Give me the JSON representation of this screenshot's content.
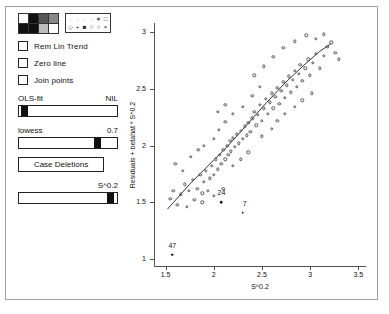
{
  "window": {
    "title": ""
  },
  "panel": {
    "shade_palette": {
      "name": "fill-shade-palette",
      "cells": [
        "#ffffff",
        "#111111",
        "#555555",
        "#888888",
        "#111111",
        "#111111",
        "#bbbbbb",
        "#ffffff"
      ]
    },
    "symbol_palette": {
      "name": "plot-symbol-palette",
      "glyphs": [
        "·",
        "·",
        "·",
        "·",
        "∗",
        "□",
        "◇",
        "+",
        "■",
        "○",
        "○",
        "×"
      ]
    },
    "checkboxes": [
      {
        "label": "Rem Lin Trend",
        "checked": false
      },
      {
        "label": "Zero line",
        "checked": false
      },
      {
        "label": "Join points",
        "checked": false
      }
    ],
    "sliders": [
      {
        "label": "OLS-fit",
        "value": "NIL",
        "thumb_pct": 2
      },
      {
        "label": "lowess",
        "value": "0.7",
        "thumb_pct": 77
      },
      {
        "label": "",
        "value": "S^0.2",
        "thumb_pct": 90
      }
    ],
    "buttons": [
      {
        "label": "Case Deletions"
      }
    ]
  },
  "chart_data": {
    "type": "scatter",
    "title": "",
    "xlabel": "S^0.2",
    "ylabel": "Residuals + betahat * S^0.2",
    "xlim": [
      1.38,
      3.58
    ],
    "ylim": [
      0.93,
      3.08
    ],
    "xticks": [
      1.5,
      2,
      2.5,
      3,
      3.5
    ],
    "xticklabels": [
      "1.5",
      "2",
      "2.5",
      "3",
      "3.5"
    ],
    "yticks": [
      1,
      1.5,
      2,
      2.5,
      3
    ],
    "yticklabels": [
      "1",
      "1.5",
      "2",
      "2.5",
      "3"
    ],
    "grid": false,
    "legend": null,
    "marker": "open-circle",
    "fit_line": {
      "name": "lowess-fit-line",
      "points": [
        [
          1.52,
          1.44
        ],
        [
          1.75,
          1.66
        ],
        [
          1.95,
          1.83
        ],
        [
          2.15,
          2.0
        ],
        [
          2.35,
          2.19
        ],
        [
          2.55,
          2.38
        ],
        [
          2.75,
          2.56
        ],
        [
          2.95,
          2.72
        ],
        [
          3.1,
          2.83
        ],
        [
          3.22,
          2.9
        ]
      ]
    },
    "points": [
      [
        1.55,
        1.53
      ],
      [
        1.58,
        1.6
      ],
      [
        1.62,
        1.48
      ],
      [
        1.66,
        1.57
      ],
      [
        1.7,
        1.66
      ],
      [
        1.74,
        1.6
      ],
      [
        1.78,
        1.7
      ],
      [
        1.8,
        1.52
      ],
      [
        1.83,
        1.62
      ],
      [
        1.86,
        1.74
      ],
      [
        1.88,
        1.58
      ],
      [
        1.9,
        1.68
      ],
      [
        1.92,
        1.78
      ],
      [
        1.94,
        1.6
      ],
      [
        1.96,
        1.71
      ],
      [
        1.98,
        1.82
      ],
      [
        2.0,
        1.74
      ],
      [
        2.02,
        1.88
      ],
      [
        2.04,
        1.79
      ],
      [
        2.06,
        1.92
      ],
      [
        2.08,
        1.84
      ],
      [
        2.1,
        1.96
      ],
      [
        2.12,
        1.88
      ],
      [
        2.14,
        2.0
      ],
      [
        2.15,
        1.92
      ],
      [
        2.17,
        2.04
      ],
      [
        2.18,
        1.95
      ],
      [
        2.2,
        2.07
      ],
      [
        2.22,
        1.99
      ],
      [
        2.24,
        2.1
      ],
      [
        2.26,
        2.02
      ],
      [
        2.28,
        2.13
      ],
      [
        2.3,
        2.06
      ],
      [
        2.32,
        2.17
      ],
      [
        2.34,
        2.09
      ],
      [
        2.36,
        2.2
      ],
      [
        2.38,
        2.12
      ],
      [
        2.4,
        2.24
      ],
      [
        2.42,
        2.3
      ],
      [
        2.44,
        2.18
      ],
      [
        2.46,
        2.27
      ],
      [
        2.48,
        2.36
      ],
      [
        2.5,
        2.22
      ],
      [
        2.52,
        2.33
      ],
      [
        2.54,
        2.41
      ],
      [
        2.56,
        2.28
      ],
      [
        2.58,
        2.38
      ],
      [
        2.6,
        2.46
      ],
      [
        2.62,
        2.33
      ],
      [
        2.64,
        2.43
      ],
      [
        2.66,
        2.51
      ],
      [
        2.68,
        2.37
      ],
      [
        2.7,
        2.48
      ],
      [
        2.72,
        2.56
      ],
      [
        2.74,
        2.42
      ],
      [
        2.76,
        2.53
      ],
      [
        2.78,
        2.61
      ],
      [
        2.8,
        2.47
      ],
      [
        2.82,
        2.58
      ],
      [
        2.84,
        2.66
      ],
      [
        2.86,
        2.52
      ],
      [
        2.88,
        2.63
      ],
      [
        2.9,
        2.71
      ],
      [
        2.92,
        2.57
      ],
      [
        2.95,
        2.68
      ],
      [
        2.98,
        2.76
      ],
      [
        3.0,
        2.62
      ],
      [
        3.03,
        2.73
      ],
      [
        3.06,
        2.81
      ],
      [
        3.1,
        2.68
      ],
      [
        3.14,
        2.79
      ],
      [
        3.18,
        2.87
      ],
      [
        3.22,
        2.91
      ],
      [
        3.26,
        2.82
      ],
      [
        3.3,
        2.76
      ],
      [
        1.6,
        1.84
      ],
      [
        1.68,
        1.78
      ],
      [
        1.76,
        1.9
      ],
      [
        1.84,
        1.96
      ],
      [
        2.05,
        2.14
      ],
      [
        2.12,
        2.21
      ],
      [
        2.2,
        2.28
      ],
      [
        2.3,
        2.34
      ],
      [
        2.4,
        2.44
      ],
      [
        2.48,
        2.52
      ],
      [
        2.2,
        1.82
      ],
      [
        2.28,
        1.88
      ],
      [
        2.36,
        1.94
      ],
      [
        2.5,
        2.08
      ],
      [
        2.6,
        2.15
      ],
      [
        2.66,
        2.22
      ],
      [
        2.74,
        2.28
      ],
      [
        2.84,
        2.34
      ],
      [
        2.92,
        2.4
      ],
      [
        3.02,
        2.46
      ],
      [
        2.42,
        2.62
      ],
      [
        2.52,
        2.7
      ],
      [
        2.62,
        2.78
      ],
      [
        2.72,
        2.86
      ],
      [
        2.84,
        2.92
      ],
      [
        2.96,
        2.97
      ],
      [
        3.06,
        2.94
      ],
      [
        3.14,
        2.98
      ],
      [
        2.04,
        2.3
      ],
      [
        2.12,
        2.36
      ],
      [
        1.9,
        2.0
      ],
      [
        2.0,
        2.06
      ],
      [
        1.72,
        1.46
      ],
      [
        1.88,
        1.5
      ],
      [
        2.0,
        1.56
      ],
      [
        2.1,
        1.62
      ]
    ],
    "labeled_points": [
      {
        "id": "24",
        "x": 2.08,
        "y": 1.5,
        "marker": "filled-circle",
        "label_dx": 0,
        "label_dy": -10
      },
      {
        "id": "7",
        "x": 2.3,
        "y": 1.41,
        "marker": "filled-circle",
        "label_dx": 2,
        "label_dy": -10
      },
      {
        "id": "47",
        "x": 1.57,
        "y": 1.04,
        "marker": "filled-circle",
        "label_dx": 0,
        "label_dy": -10
      }
    ]
  }
}
